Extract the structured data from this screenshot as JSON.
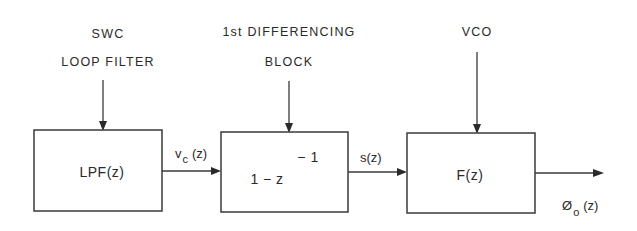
{
  "diagram": {
    "type": "block-diagram",
    "blocks": [
      {
        "id": "lpf",
        "title_lines": [
          "SWC",
          "LOOP FILTER"
        ],
        "content": "LPF(z)"
      },
      {
        "id": "diff",
        "title_lines": [
          "1st DIFFERENCING",
          "BLOCK"
        ],
        "content_base": "1 − z",
        "content_exponent": "− 1"
      },
      {
        "id": "vco",
        "title_lines": [
          "VCO"
        ],
        "content": "F(z)"
      }
    ],
    "signals": [
      {
        "from": "lpf",
        "to": "diff",
        "name": "v",
        "subscript": "c",
        "arg": "(z)"
      },
      {
        "from": "diff",
        "to": "vco",
        "name": "s(z)"
      },
      {
        "from": "vco",
        "to": "output",
        "name": "Ø",
        "subscript": "o",
        "arg": "(z)"
      }
    ]
  }
}
